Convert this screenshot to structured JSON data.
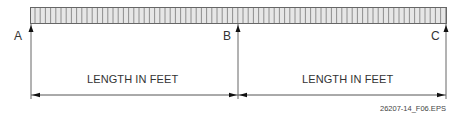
{
  "diagram": {
    "points": [
      {
        "label": "A",
        "x": 31
      },
      {
        "label": "B",
        "x": 238
      },
      {
        "label": "C",
        "x": 446
      }
    ],
    "dimensions": [
      {
        "label": "LENGTH IN FEET",
        "from": "A",
        "to": "B"
      },
      {
        "label": "LENGTH IN FEET",
        "from": "B",
        "to": "C"
      }
    ],
    "figure_id": "26207-14_F06.EPS",
    "colors": {
      "bar_fill": "#e6e6e6",
      "line": "#555555",
      "arrow": "#111111"
    }
  }
}
